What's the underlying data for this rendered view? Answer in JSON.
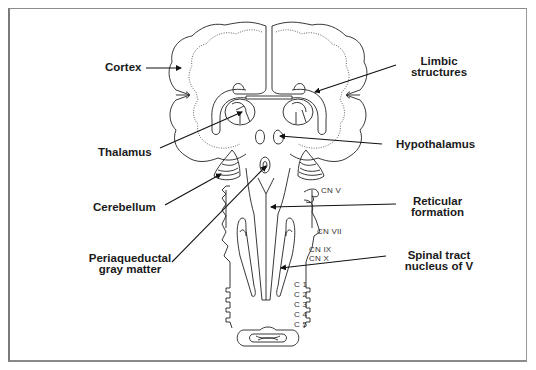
{
  "figure": {
    "frame_color": "#8c8c8c",
    "labels": {
      "cortex": "Cortex",
      "limbic_line1": "Limbic",
      "limbic_line2": "structures",
      "thalamus": "Thalamus",
      "hypothalamus": "Hypothalamus",
      "cerebellum": "Cerebellum",
      "reticular_line1": "Reticular",
      "reticular_line2": "formation",
      "periaqueductal_line1": "Periaqueductal",
      "periaqueductal_line2": "gray matter",
      "spinal_line1": "Spinal tract",
      "spinal_line2": "nucleus of V"
    },
    "nerves": {
      "cn5": "CN V",
      "cn7": "CN VII",
      "cn9": "CN IX",
      "cn10": "CN X",
      "c1": "C 1",
      "c2": "C 2",
      "c3": "C 3",
      "c4": "C 4",
      "c5": "C 5"
    },
    "pointers": [
      {
        "name": "cortex",
        "from": [
          146,
          68
        ],
        "to": [
          181,
          68
        ]
      },
      {
        "name": "limbic-structures",
        "from": [
          396,
          65
        ],
        "to": [
          315,
          92
        ]
      },
      {
        "name": "thalamus",
        "from": [
          160,
          148
        ],
        "to": [
          242,
          112
        ]
      },
      {
        "name": "hypothalamus",
        "from": [
          382,
          144
        ],
        "to": [
          280,
          136
        ]
      },
      {
        "name": "cerebellum",
        "from": [
          165,
          205
        ],
        "to": [
          221,
          174
        ]
      },
      {
        "name": "periaqueductal",
        "from": [
          172,
          262
        ],
        "to": [
          266,
          166
        ]
      },
      {
        "name": "reticular-formation",
        "from": [
          396,
          204
        ],
        "to": [
          271,
          207
        ]
      },
      {
        "name": "spinal-tract",
        "from": [
          386,
          256
        ],
        "to": [
          281,
          268
        ]
      }
    ]
  }
}
